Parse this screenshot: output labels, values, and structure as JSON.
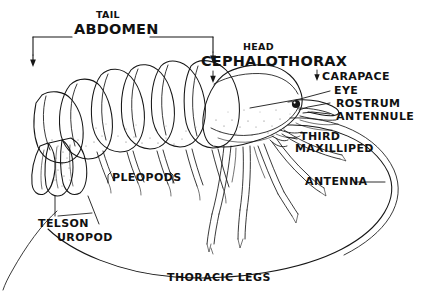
{
  "diagram": {
    "background_color": "#ffffff",
    "ink_color": "#161616",
    "caption": "THORACIC LEGS",
    "labels": {
      "tail": "TAIL",
      "abdomen": "ABDOMEN",
      "head": "HEAD",
      "cephalothorax": "CEPHALOTHORAX",
      "carapace": "CARAPACE",
      "eye": "EYE",
      "rostrum": "ROSTRUM",
      "antennule": "ANTENNULE",
      "third": "THIRD",
      "maxilliped": "MAXILLIPED",
      "pleopods": "PLEOPODS",
      "telson": "TELSON",
      "uropod": "UROPOD",
      "antenna": "ANTENNA",
      "thoracic_legs": "THORACIC LEGS"
    }
  }
}
